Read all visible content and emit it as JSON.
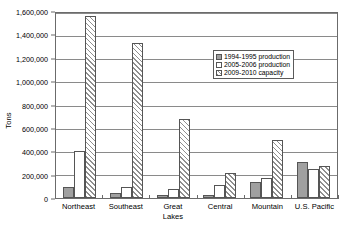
{
  "chart_data": {
    "type": "bar",
    "title": "",
    "xlabel": "",
    "ylabel": "Tons",
    "ylim": [
      0,
      1600000
    ],
    "ytick_step": 200000,
    "grid": true,
    "legend_position": "inside-upper-right",
    "categories": [
      "Northeast",
      "Southeast",
      "Great Lakes",
      "Central",
      "Mountain",
      "U.S. Pacific"
    ],
    "category_lines": [
      [
        "Northeast"
      ],
      [
        "Southeast"
      ],
      [
        "Great",
        "Lakes"
      ],
      [
        "Central"
      ],
      [
        "Mountain"
      ],
      [
        "U.S. Pacific"
      ]
    ],
    "ytick_labels": [
      "1,600,000",
      "1,400,000",
      "1,200,000",
      "1,000,000",
      "800,000",
      "600,000",
      "400,000",
      "200,000",
      "0"
    ],
    "ytick_values": [
      1600000,
      1400000,
      1200000,
      1000000,
      800000,
      600000,
      400000,
      200000,
      0
    ],
    "series": [
      {
        "name": "1994-1995 production",
        "style": "solid-gray",
        "color": "#a0a0a0",
        "values": [
          90000,
          45000,
          30000,
          22000,
          140000,
          310000
        ]
      },
      {
        "name": "2005-2006 production",
        "style": "white",
        "color": "#ffffff",
        "values": [
          405000,
          95000,
          75000,
          115000,
          175000,
          250000
        ]
      },
      {
        "name": "2009-2010 capacity",
        "style": "hatched",
        "color": "#ffffff",
        "values": [
          1560000,
          1325000,
          680000,
          215000,
          495000,
          275000
        ]
      }
    ]
  },
  "legend": {
    "items": [
      {
        "label": "1994-1995 production"
      },
      {
        "label": "2005-2006 production"
      },
      {
        "label": "2009-2010 capacity"
      }
    ]
  }
}
